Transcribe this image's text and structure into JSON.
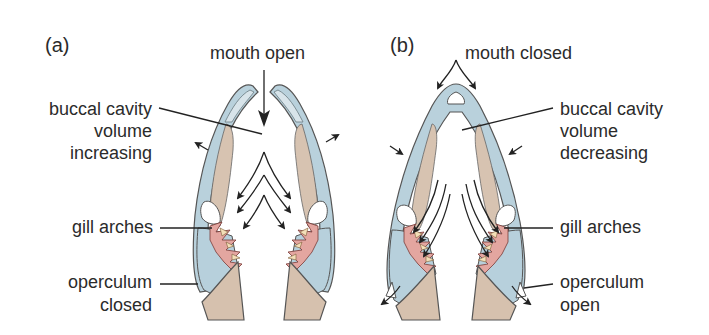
{
  "figure": {
    "panels": [
      {
        "id": "a",
        "label": "(a)",
        "title": "mouth open",
        "labels": {
          "cavity_line1": "buccal cavity",
          "cavity_line2": "volume",
          "cavity_line3": "increasing",
          "gills": "gill arches",
          "operculum_line1": "operculum",
          "operculum_line2": "closed"
        }
      },
      {
        "id": "b",
        "label": "(b)",
        "title": "mouth closed",
        "labels": {
          "cavity_line1": "buccal cavity",
          "cavity_line2": "volume",
          "cavity_line3": "decreasing",
          "gills": "gill arches",
          "operculum_line1": "operculum",
          "operculum_line2": "open"
        }
      }
    ],
    "colors": {
      "bone_blue": "#b9d1dc",
      "muscle_tan": "#d7c3b1",
      "gill_pink": "#e3a6a0",
      "raker_cream": "#f3dfb8",
      "text": "#2b2b2b"
    }
  }
}
